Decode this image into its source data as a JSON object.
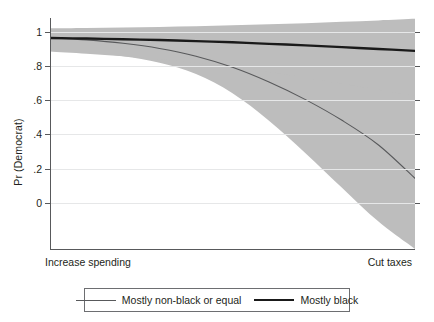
{
  "chart_data": {
    "type": "line",
    "title": "",
    "xlabel": "",
    "ylabel": "Pr (Democrat)",
    "grid": true,
    "legend_position": "bottom",
    "x_axis": {
      "left_label": "Increase spending",
      "right_label": "Cut taxes",
      "xlim": [
        0,
        1
      ],
      "ticks": []
    },
    "y_axis": {
      "ylim": [
        -0.27,
        1.08
      ],
      "tick_values": [
        1,
        0.8,
        0.6,
        0.4,
        0.2,
        0
      ],
      "tick_labels": [
        "1",
        ".8",
        ".6",
        ".4",
        ".2",
        "0"
      ]
    },
    "x": [
      0,
      0.1,
      0.2,
      0.3,
      0.4,
      0.5,
      0.6,
      0.7,
      0.8,
      0.9,
      1
    ],
    "series": [
      {
        "name": "Mostly non-black or equal",
        "style": "thin",
        "color": "#58595b",
        "values": [
          0.965,
          0.952,
          0.932,
          0.902,
          0.857,
          0.792,
          0.706,
          0.603,
          0.482,
          0.338,
          0.143
        ],
        "ci_upper": [
          1.0,
          0.992,
          0.982,
          0.97,
          0.956,
          0.938,
          0.917,
          0.893,
          0.868,
          0.848,
          0.838
        ],
        "ci_lower": [
          0.893,
          0.878,
          0.856,
          0.818,
          0.752,
          0.64,
          0.48,
          0.29,
          0.088,
          -0.11,
          -0.27
        ]
      },
      {
        "name": "Mostly black",
        "style": "thick",
        "color": "#1a1a1a",
        "values": [
          0.963,
          0.96,
          0.956,
          0.951,
          0.945,
          0.938,
          0.929,
          0.92,
          0.91,
          0.899,
          0.888
        ],
        "ci_upper": [
          1.02,
          1.022,
          1.025,
          1.028,
          1.032,
          1.037,
          1.043,
          1.05,
          1.058,
          1.066,
          1.075
        ],
        "ci_lower": [
          0.884,
          0.871,
          0.856,
          0.839,
          0.818,
          0.793,
          0.764,
          0.731,
          0.696,
          0.66,
          0.625
        ]
      }
    ],
    "band_color": "#bdbdbd"
  },
  "legend": {
    "items": [
      {
        "label": "Mostly non-black or equal"
      },
      {
        "label": "Mostly black"
      }
    ]
  }
}
